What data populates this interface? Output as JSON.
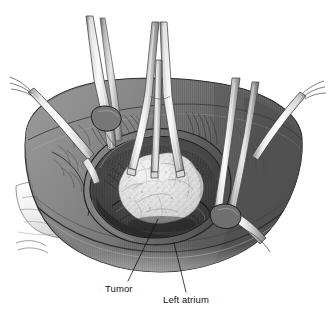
{
  "figure": {
    "view": "operative field, superior oblique",
    "style": "grayscale line-and-wash medical illustration",
    "background_color": "#ffffff",
    "ink_color": "#111111",
    "palette": {
      "heart_midtone": "#808080",
      "heart_shadow": "#5a5a5a",
      "heart_dark": "#4a4a4a",
      "heart_highlight": "#9a9a9a",
      "atrium_rim": "#6e6e6e",
      "cavity_dark": "#3f3f3f",
      "tumor_light": "#e4e4e4",
      "tumor_shade": "#bdbdbd",
      "instrument_light": "#f2f2f2",
      "instrument_mid": "#c8c8c8",
      "instrument_edge": "#6f6f6f",
      "tape_white": "#f7f7f7"
    },
    "labels": [
      {
        "id": "tumor",
        "text": "Tumor",
        "x": 105,
        "y": 284,
        "leader": {
          "from_x": 128,
          "from_y": 281,
          "to_x": 158,
          "to_y": 219
        }
      },
      {
        "id": "left-atrium",
        "text": "Left atrium",
        "x": 163,
        "y": 295,
        "leader": {
          "from_x": 186,
          "from_y": 292,
          "to_x": 174,
          "to_y": 243
        }
      }
    ],
    "structures": [
      {
        "name": "left-atrium-body",
        "description": "opened left atrium forming the operative cavity"
      },
      {
        "name": "atriotomy-rim",
        "description": "cut edge of the atrial wall encircling the cavity"
      },
      {
        "name": "tumor-mass",
        "description": "lobulated gelatinous myxoma within the atrial cavity"
      },
      {
        "name": "retractor-blade-left",
        "description": "malleable retractor blade on the left atrial wall"
      },
      {
        "name": "retractor-blade-center",
        "description": "central retractor blades holding the atriotomy open"
      },
      {
        "name": "retractor-blade-right",
        "description": "retractor blades on the right atrial wall"
      },
      {
        "name": "vessel-tape-left",
        "description": "umbilical tape / snare encircling a great vessel, left"
      },
      {
        "name": "vessel-tape-right",
        "description": "umbilical tape / snare encircling a great vessel, right"
      },
      {
        "name": "epicardial-fat",
        "description": "pericardial and epicardial tissue at lower left"
      }
    ]
  }
}
